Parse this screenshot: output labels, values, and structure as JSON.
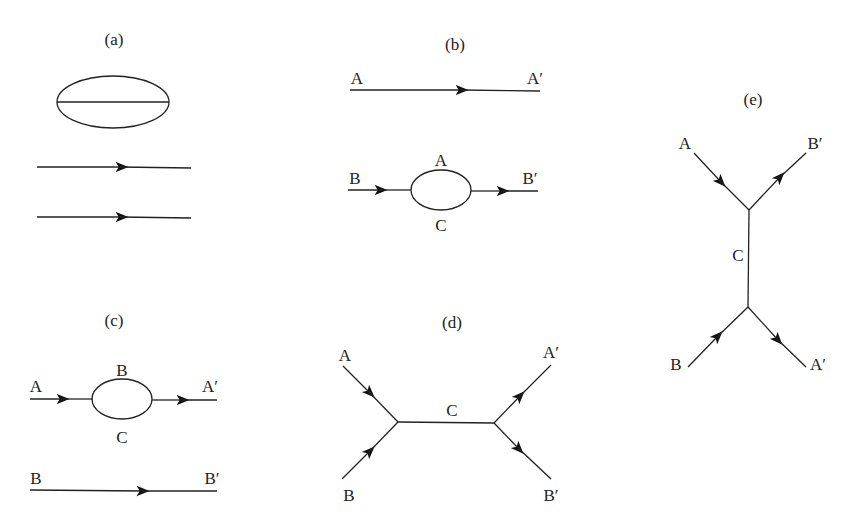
{
  "diagrams": {
    "a": {
      "title": "(a)"
    },
    "b": {
      "title": "(b)",
      "labels": {
        "top_in": "A",
        "top_out": "A′",
        "in": "B",
        "out": "B′",
        "loop_top": "A",
        "loop_bottom": "C"
      }
    },
    "c": {
      "title": "(c)",
      "labels": {
        "in": "A",
        "out": "A′",
        "loop_top": "B",
        "loop_bottom": "C",
        "bottom_in": "B",
        "bottom_out": "B′"
      }
    },
    "d": {
      "title": "(d)",
      "labels": {
        "in_top": "A",
        "in_bottom": "B",
        "out_top": "A′",
        "out_bottom": "B′",
        "propagator": "C"
      }
    },
    "e": {
      "title": "(e)",
      "labels": {
        "in_top": "A",
        "out_top": "B′",
        "in_bottom": "B",
        "out_bottom": "A′",
        "propagator": "C"
      }
    }
  },
  "colors": {
    "line": "#222222",
    "background": "#ffffff"
  }
}
